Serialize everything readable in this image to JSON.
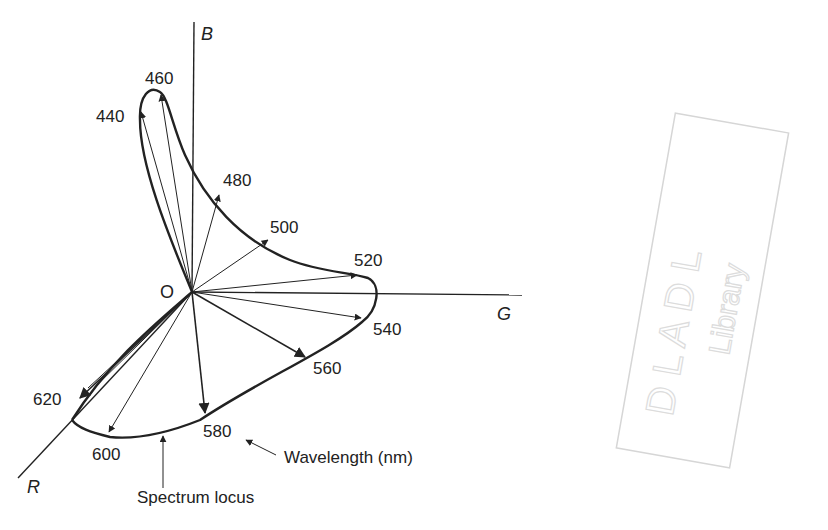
{
  "diagram": {
    "type": "3D tristimulus vector diagram (RGB space)",
    "axes": {
      "b": "B",
      "g": "G",
      "r": "R",
      "origin": "O"
    },
    "wavelength_labels": [
      "440",
      "460",
      "480",
      "500",
      "520",
      "540",
      "560",
      "580",
      "600",
      "620"
    ],
    "annotations": {
      "wavelength": "Wavelength (nm)",
      "spectrum_locus": "Spectrum locus"
    },
    "stamp": {
      "line1": "D L A D L",
      "line2": "Library"
    },
    "colors": {
      "ink": "#222222",
      "background": "#ffffff",
      "stamp": "#dcdcdc"
    }
  }
}
